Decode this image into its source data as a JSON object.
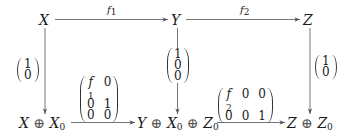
{
  "diagram": {
    "type": "commutative-diagram",
    "top_row": {
      "X": "X",
      "Y": "Y",
      "Z": "Z"
    },
    "bottom_row": {
      "left": {
        "a": "X",
        "op": "⊕",
        "b": "X",
        "b_sub": "0"
      },
      "middle": {
        "a": "Y",
        "op1": "⊕",
        "b": "X",
        "b_sub": "0",
        "op2": "⊕",
        "c": "Z",
        "c_sub": "0"
      },
      "right": {
        "a": "Z",
        "op": "⊕",
        "b": "Z",
        "b_sub": "0"
      }
    },
    "horizontal_arrows": {
      "top_left": {
        "label": "f",
        "label_sub": "1",
        "from": "X",
        "to": "Y"
      },
      "top_right": {
        "label": "f",
        "label_sub": "2",
        "from": "Y",
        "to": "Z"
      },
      "bottom_left": {
        "from": "X ⊕ X0",
        "to": "Y ⊕ X0 ⊕ Z0",
        "matrix": [
          [
            "f1",
            "0"
          ],
          [
            "0",
            "1"
          ],
          [
            "0",
            "0"
          ]
        ],
        "cells": {
          "r0c0": "f",
          "r0c0_sub": "1",
          "r0c1": "0",
          "r1c0": "0",
          "r1c1": "1",
          "r2c0": "0",
          "r2c1": "0"
        }
      },
      "bottom_right": {
        "from": "Y ⊕ X0 ⊕ Z0",
        "to": "Z ⊕ Z0",
        "matrix": [
          [
            "f2",
            "0",
            "0"
          ],
          [
            "0",
            "0",
            "1"
          ]
        ],
        "cells": {
          "r0c0": "f",
          "r0c0_sub": "2",
          "r0c1": "0",
          "r0c2": "0",
          "r1c0": "0",
          "r1c1": "0",
          "r1c2": "1"
        }
      }
    },
    "vertical_arrows": {
      "left": {
        "from": "X",
        "to": "X ⊕ X0",
        "vector": [
          "1",
          "0"
        ]
      },
      "middle": {
        "from": "Y",
        "to": "Y ⊕ X0 ⊕ Z0",
        "vector": [
          "1",
          "0",
          "0"
        ]
      },
      "right": {
        "from": "Z",
        "to": "Z ⊕ Z0",
        "vector": [
          "1",
          "0"
        ]
      }
    },
    "colors": {
      "stroke": "#555555",
      "text": "#1a1a1a",
      "background": "#ffffff"
    }
  }
}
